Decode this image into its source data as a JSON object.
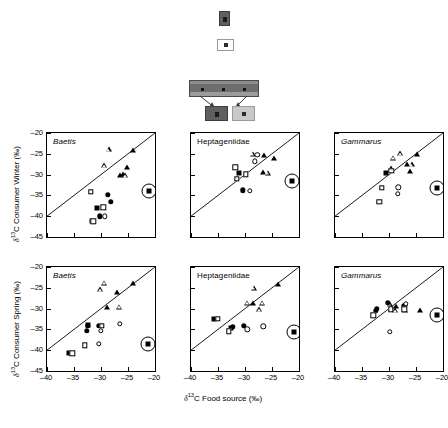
{
  "overlay": {
    "name": "floating-toolbar-artifact",
    "dark_chip_label": "",
    "light_chip_label": "",
    "bar_label": ""
  },
  "figure": {
    "axis_x_title": "δ13C Food source (‰)",
    "axis_y_title_top": "δ13C Consumer Winter (‰)",
    "axis_y_title_bottom": "δ13C Consumer Spring (‰)",
    "x_ticks": [
      "-40",
      "-35",
      "-30",
      "-25",
      "-20"
    ],
    "y_ticks": [
      "-20",
      "-25",
      "-30",
      "-35",
      "-40",
      "-45"
    ],
    "xlim": [
      -40,
      -20
    ],
    "ylim": [
      -45,
      -20
    ],
    "panel_titles": [
      "Baetis",
      "Heptageniidae",
      "Gammarus"
    ]
  },
  "chart_data": [
    {
      "type": "scatter",
      "title": "Baetis",
      "row": "Winter",
      "xlabel": "δ13C Food source (‰)",
      "ylabel": "δ13C Consumer Winter (‰)",
      "xlim": [
        -40,
        -20
      ],
      "ylim": [
        -45,
        -20
      ],
      "grid": false,
      "reference_line": "1:1",
      "series": [
        {
          "name": "filled-triangle",
          "points": [
            [
              -24.0,
              -24.2
            ],
            [
              -25.2,
              -28.2
            ],
            [
              -26.0,
              -29.8
            ],
            [
              -26.4,
              -30.0
            ]
          ]
        },
        {
          "name": "open-triangle",
          "points": [
            [
              -28.6,
              -23.9
            ],
            [
              -29.5,
              -27.8
            ],
            [
              -25.6,
              -30.1
            ]
          ]
        },
        {
          "name": "filled-circle",
          "points": [
            [
              -28.7,
              -34.8
            ],
            [
              -28.2,
              -36.6
            ],
            [
              -30.2,
              -40.0
            ]
          ]
        },
        {
          "name": "open-circle",
          "points": [
            [
              -29.3,
              -40.0
            ]
          ]
        },
        {
          "name": "filled-square",
          "points": [
            [
              -30.8,
              -38.0
            ],
            [
              -31.6,
              -41.2
            ]
          ]
        },
        {
          "name": "open-square",
          "points": [
            [
              -31.9,
              -34.2
            ],
            [
              -29.6,
              -37.9
            ],
            [
              -31.4,
              -41.2
            ]
          ]
        },
        {
          "name": "circled-filled-square",
          "points": [
            [
              -21.2,
              -34.0
            ]
          ]
        }
      ]
    },
    {
      "type": "scatter",
      "title": "Heptageniidae",
      "row": "Winter",
      "xlabel": "δ13C Food source (‰)",
      "ylabel": "δ13C Consumer Winter (‰)",
      "xlim": [
        -40,
        -20
      ],
      "ylim": [
        -45,
        -20
      ],
      "grid": false,
      "reference_line": "1:1",
      "series": [
        {
          "name": "filled-triangle",
          "points": [
            [
              -26.4,
              -25.2
            ],
            [
              -24.6,
              -26.0
            ],
            [
              -26.6,
              -29.4
            ]
          ]
        },
        {
          "name": "open-triangle",
          "points": [
            [
              -28.6,
              -25.0
            ],
            [
              -25.8,
              -29.6
            ]
          ]
        },
        {
          "name": "filled-circle",
          "points": [
            [
              -30.4,
              -33.8
            ]
          ]
        },
        {
          "name": "open-circle",
          "points": [
            [
              -27.7,
              -25.2
            ],
            [
              -28.2,
              -26.8
            ],
            [
              -29.1,
              -33.9
            ]
          ]
        },
        {
          "name": "filled-square",
          "points": [
            [
              -31.1,
              -29.6
            ]
          ]
        },
        {
          "name": "open-square",
          "points": [
            [
              -31.8,
              -28.2
            ],
            [
              -31.5,
              -31.0
            ],
            [
              -29.8,
              -29.9
            ]
          ]
        },
        {
          "name": "circled-filled-square",
          "points": [
            [
              -21.3,
              -31.6
            ]
          ]
        }
      ]
    },
    {
      "type": "scatter",
      "title": "Gammarus",
      "row": "Winter",
      "xlabel": "δ13C Food source (‰)",
      "ylabel": "δ13C Consumer Winter (‰)",
      "xlim": [
        -40,
        -20
      ],
      "ylim": [
        -45,
        -20
      ],
      "grid": false,
      "reference_line": "1:1",
      "series": [
        {
          "name": "filled-triangle",
          "points": [
            [
              -24.8,
              -25.0
            ],
            [
              -26.7,
              -27.4
            ],
            [
              -26.2,
              -29.2
            ]
          ]
        },
        {
          "name": "open-triangle",
          "points": [
            [
              -28.0,
              -24.9
            ],
            [
              -29.2,
              -26.0
            ],
            [
              -29.7,
              -28.5
            ],
            [
              -25.8,
              -27.5
            ]
          ]
        },
        {
          "name": "filled-circle",
          "points": []
        },
        {
          "name": "open-circle",
          "points": [
            [
              -28.3,
              -33.1
            ],
            [
              -28.4,
              -34.6
            ]
          ]
        },
        {
          "name": "filled-square",
          "points": [
            [
              -30.6,
              -29.5
            ]
          ]
        },
        {
          "name": "open-square",
          "points": [
            [
              -29.6,
              -29.1
            ],
            [
              -31.3,
              -33.2
            ],
            [
              -31.8,
              -36.5
            ]
          ]
        },
        {
          "name": "circled-filled-square",
          "points": [
            [
              -21.2,
              -33.2
            ]
          ]
        }
      ]
    },
    {
      "type": "scatter",
      "title": "Baetis",
      "row": "Spring",
      "xlabel": "δ13C Food source (‰)",
      "ylabel": "δ13C Consumer Spring (‰)",
      "xlim": [
        -40,
        -20
      ],
      "ylim": [
        -45,
        -20
      ],
      "grid": false,
      "reference_line": "1:1",
      "series": [
        {
          "name": "filled-triangle",
          "points": [
            [
              -24.0,
              -23.9
            ],
            [
              -27.0,
              -25.9
            ],
            [
              -28.8,
              -29.6
            ]
          ]
        },
        {
          "name": "open-triangle",
          "points": [
            [
              -29.4,
              -23.8
            ],
            [
              -30.1,
              -25.4
            ],
            [
              -26.6,
              -29.6
            ]
          ]
        },
        {
          "name": "filled-circle",
          "points": [
            [
              -32.5,
              -34.2
            ],
            [
              -32.6,
              -35.3
            ],
            [
              -30.4,
              -34.1
            ]
          ]
        },
        {
          "name": "open-circle",
          "points": [
            [
              -26.5,
              -33.7
            ],
            [
              -30.0,
              -35.4
            ],
            [
              -30.4,
              -38.5
            ]
          ]
        },
        {
          "name": "filled-square",
          "points": [
            [
              -32.4,
              -33.9
            ],
            [
              -36.0,
              -40.6
            ]
          ]
        },
        {
          "name": "open-square",
          "points": [
            [
              -29.9,
              -34.2
            ],
            [
              -33.0,
              -38.8
            ],
            [
              -35.3,
              -40.7
            ]
          ]
        },
        {
          "name": "circled-filled-square",
          "points": [
            [
              -21.3,
              -38.6
            ]
          ]
        }
      ]
    },
    {
      "type": "scatter",
      "title": "Heptageniidae",
      "row": "Spring",
      "xlabel": "δ13C Food source (‰)",
      "ylabel": "δ13C Consumer Spring (‰)",
      "xlim": [
        -40,
        -20
      ],
      "ylim": [
        -45,
        -20
      ],
      "grid": false,
      "reference_line": "1:1",
      "series": [
        {
          "name": "filled-triangle",
          "points": [
            [
              -23.9,
              -24.2
            ],
            [
              -28.5,
              -28.6
            ]
          ]
        },
        {
          "name": "open-triangle",
          "points": [
            [
              -28.4,
              -25.0
            ],
            [
              -29.6,
              -28.6
            ],
            [
              -26.9,
              -28.6
            ],
            [
              -27.4,
              -30.2
            ]
          ]
        },
        {
          "name": "filled-circle",
          "points": [
            [
              -32.3,
              -34.4
            ],
            [
              -30.2,
              -34.2
            ]
          ]
        },
        {
          "name": "open-circle",
          "points": [
            [
              -29.6,
              -35.0
            ],
            [
              -26.6,
              -34.3
            ]
          ]
        },
        {
          "name": "filled-square",
          "points": [
            [
              -35.8,
              -32.4
            ],
            [
              -32.6,
              -34.6
            ]
          ]
        },
        {
          "name": "open-square",
          "points": [
            [
              -35.0,
              -32.4
            ],
            [
              -33.0,
              -35.5
            ]
          ]
        },
        {
          "name": "circled-filled-square",
          "points": [
            [
              -21.0,
              -35.6
            ]
          ]
        }
      ]
    },
    {
      "type": "scatter",
      "title": "Gammarus",
      "row": "Spring",
      "xlabel": "δ13C Food source (‰)",
      "ylabel": "δ13C Consumer Spring (‰)",
      "xlim": [
        -40,
        -20
      ],
      "ylim": [
        -45,
        -20
      ],
      "grid": false,
      "reference_line": "1:1",
      "series": [
        {
          "name": "filled-triangle",
          "points": [
            [
              -28.7,
              -29.4
            ],
            [
              -24.3,
              -30.4
            ]
          ]
        },
        {
          "name": "open-triangle",
          "points": [
            [
              -29.9,
              -28.8
            ],
            [
              -29.3,
              -30.1
            ],
            [
              -28.9,
              -30.4
            ],
            [
              -27.0,
              -30.3
            ]
          ]
        },
        {
          "name": "filled-circle",
          "points": [
            [
              -30.2,
              -28.6
            ],
            [
              -32.3,
              -30.0
            ],
            [
              -32.4,
              -30.6
            ],
            [
              -27.2,
              -29.3
            ]
          ]
        },
        {
          "name": "open-circle",
          "points": [
            [
              -26.9,
              -28.9
            ],
            [
              -29.9,
              -35.6
            ]
          ]
        },
        {
          "name": "filled-square",
          "points": []
        },
        {
          "name": "open-square",
          "points": [
            [
              -29.7,
              -30.2
            ],
            [
              -27.2,
              -30.2
            ],
            [
              -32.9,
              -31.6
            ]
          ]
        },
        {
          "name": "circled-filled-square",
          "points": [
            [
              -21.1,
              -31.6
            ]
          ]
        }
      ]
    }
  ]
}
